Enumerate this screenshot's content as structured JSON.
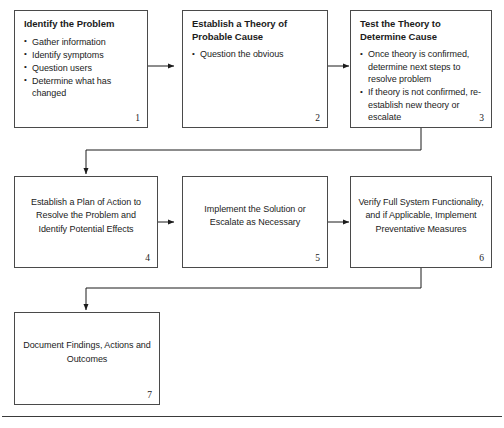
{
  "diagram": {
    "type": "flowchart",
    "orientation": "left-to-right, serpentine rows",
    "border_color": "#4a4a4a",
    "background_color": "#ffffff",
    "text_color": "#1b1b1b",
    "nodes": [
      {
        "number": "1",
        "title": "Identify the Problem",
        "body_style": "bulleted",
        "bullets": [
          "Gather information",
          "Identify symptoms",
          "Question users",
          "Determine what has changed"
        ]
      },
      {
        "number": "2",
        "title": "Establish a Theory of Probable Cause",
        "body_style": "bulleted",
        "bullets": [
          "Question the obvious"
        ]
      },
      {
        "number": "3",
        "title": "Test the Theory to Determine Cause",
        "body_style": "bulleted",
        "bullets": [
          "Once theory is confirmed, determine next steps to resolve problem",
          "If theory is not confirmed, re-establish new theory or escalate"
        ]
      },
      {
        "number": "4",
        "title": "",
        "body_style": "centered",
        "text": "Establish a Plan of Action to Resolve the Problem and Identify Potential Effects"
      },
      {
        "number": "5",
        "title": "",
        "body_style": "centered",
        "text": "Implement the Solution or Escalate as Necessary"
      },
      {
        "number": "6",
        "title": "",
        "body_style": "centered",
        "text": "Verify Full System Functionality, and if Applicable, Implement Preventative Measures"
      },
      {
        "number": "7",
        "title": "",
        "body_style": "centered",
        "text": "Document Findings, Actions and Outcomes"
      }
    ],
    "connectors": [
      {
        "from": "1",
        "to": "2",
        "shape": "horizontal-arrow"
      },
      {
        "from": "2",
        "to": "3",
        "shape": "horizontal-arrow"
      },
      {
        "from": "3",
        "to": "4",
        "shape": "elbow-down-left-arrow"
      },
      {
        "from": "4",
        "to": "5",
        "shape": "horizontal-arrow"
      },
      {
        "from": "5",
        "to": "6",
        "shape": "horizontal-arrow"
      },
      {
        "from": "6",
        "to": "7",
        "shape": "elbow-down-left-arrow"
      }
    ]
  }
}
